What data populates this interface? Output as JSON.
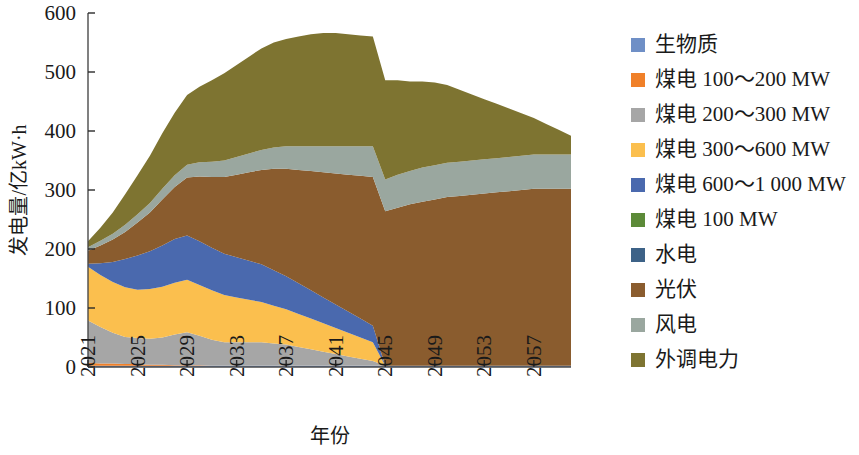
{
  "chart_data": {
    "type": "area",
    "stacked": true,
    "title": "",
    "xlabel": "年份",
    "ylabel": "发电量/亿kW·h",
    "ylim": [
      0,
      600
    ],
    "yticks": [
      0,
      100,
      200,
      300,
      400,
      500,
      600
    ],
    "xlim": [
      2021,
      2060
    ],
    "xticks": [
      2021,
      2025,
      2029,
      2033,
      2037,
      2041,
      2045,
      2049,
      2053,
      2057
    ],
    "xtick_labels": [
      "2021",
      "2025",
      "2029",
      "2033",
      "2037",
      "2041",
      "2045",
      "2049",
      "2053",
      "2057"
    ],
    "grid": false,
    "legend_position": "right",
    "x": [
      2021,
      2022,
      2023,
      2024,
      2025,
      2026,
      2027,
      2028,
      2029,
      2030,
      2031,
      2032,
      2033,
      2034,
      2035,
      2036,
      2037,
      2038,
      2039,
      2040,
      2041,
      2042,
      2043,
      2044,
      2045,
      2046,
      2047,
      2048,
      2049,
      2050,
      2051,
      2052,
      2053,
      2054,
      2055,
      2056,
      2057,
      2058,
      2059,
      2060
    ],
    "series": [
      {
        "name": "生物质",
        "color": "#6F8FC6",
        "values": [
          2,
          2,
          2,
          2,
          2,
          2,
          2,
          2,
          2,
          2,
          2,
          2,
          2,
          2,
          2,
          2,
          2,
          2,
          2,
          2,
          2,
          2,
          2,
          2,
          2,
          2,
          2,
          2,
          2,
          2,
          2,
          2,
          2,
          2,
          2,
          2,
          2,
          2,
          2,
          2
        ]
      },
      {
        "name": "煤电 100～200 MW",
        "color": "#F08029",
        "values": [
          5,
          4,
          4,
          3,
          3,
          2,
          2,
          1,
          1,
          1,
          0,
          0,
          0,
          0,
          0,
          0,
          0,
          0,
          0,
          0,
          0,
          0,
          0,
          0,
          0,
          0,
          0,
          0,
          0,
          0,
          0,
          0,
          0,
          0,
          0,
          0,
          0,
          0,
          0,
          0
        ]
      },
      {
        "name": "煤电 200～300 MW",
        "color": "#A6A6A6",
        "values": [
          72,
          62,
          52,
          46,
          44,
          44,
          46,
          52,
          56,
          50,
          44,
          40,
          40,
          40,
          40,
          38,
          36,
          32,
          28,
          24,
          20,
          16,
          12,
          8,
          0,
          0,
          0,
          0,
          0,
          0,
          0,
          0,
          0,
          0,
          0,
          0,
          0,
          0,
          0,
          0
        ]
      },
      {
        "name": "煤电 300～600 MW",
        "color": "#FBBF4E",
        "values": [
          91,
          88,
          86,
          84,
          82,
          84,
          86,
          88,
          89,
          86,
          84,
          80,
          76,
          72,
          68,
          64,
          60,
          56,
          52,
          48,
          44,
          40,
          36,
          32,
          0,
          0,
          0,
          0,
          0,
          0,
          0,
          0,
          0,
          0,
          0,
          0,
          0,
          0,
          0,
          0
        ]
      },
      {
        "name": "煤电 600～1 000 MW",
        "color": "#4A69AE",
        "values": [
          5,
          20,
          34,
          48,
          58,
          64,
          70,
          74,
          75,
          74,
          72,
          70,
          68,
          66,
          64,
          60,
          56,
          52,
          48,
          44,
          40,
          36,
          32,
          28,
          0,
          0,
          0,
          0,
          0,
          0,
          0,
          0,
          0,
          0,
          0,
          0,
          0,
          0,
          0,
          0
        ]
      },
      {
        "name": "煤电 100 MW",
        "color": "#5C8A38",
        "values": [
          0,
          0,
          0,
          0,
          0,
          0,
          0,
          0,
          0,
          0,
          0,
          0,
          0,
          0,
          0,
          0,
          0,
          0,
          0,
          0,
          0,
          0,
          0,
          0,
          0,
          0,
          0,
          0,
          0,
          0,
          0,
          0,
          0,
          0,
          0,
          0,
          0,
          0,
          0,
          0
        ]
      },
      {
        "name": "水电",
        "color": "#3D6287",
        "values": [
          0,
          0,
          0,
          0,
          0,
          0,
          0,
          0,
          0,
          0,
          0,
          0,
          0,
          0,
          0,
          0,
          0,
          0,
          0,
          0,
          0,
          0,
          0,
          0,
          0,
          0,
          0,
          0,
          0,
          0,
          0,
          0,
          0,
          0,
          0,
          0,
          0,
          0,
          0,
          0
        ]
      },
      {
        "name": "光伏",
        "color": "#8A5C2E",
        "values": [
          22,
          30,
          38,
          46,
          56,
          66,
          78,
          88,
          98,
          110,
          120,
          130,
          140,
          150,
          160,
          172,
          182,
          192,
          202,
          212,
          222,
          232,
          242,
          252,
          262,
          268,
          274,
          278,
          282,
          286,
          288,
          290,
          292,
          294,
          296,
          298,
          300,
          300,
          300,
          300
        ]
      },
      {
        "name": "风电",
        "color": "#9AA79F",
        "values": [
          6,
          8,
          10,
          12,
          14,
          16,
          18,
          20,
          22,
          24,
          26,
          28,
          30,
          32,
          34,
          36,
          38,
          40,
          42,
          44,
          46,
          48,
          50,
          52,
          54,
          56,
          56,
          58,
          58,
          58,
          58,
          58,
          58,
          58,
          58,
          58,
          58,
          58,
          58,
          58
        ]
      },
      {
        "name": "外调电力",
        "color": "#7E7431",
        "values": [
          10,
          22,
          36,
          52,
          66,
          80,
          94,
          106,
          118,
          128,
          138,
          148,
          156,
          164,
          172,
          178,
          182,
          186,
          190,
          192,
          192,
          190,
          188,
          186,
          168,
          160,
          152,
          146,
          140,
          132,
          122,
          112,
          102,
          92,
          82,
          72,
          62,
          52,
          42,
          32
        ]
      }
    ]
  },
  "legend": {
    "items": [
      {
        "label": "生物质",
        "color": "#6F8FC6"
      },
      {
        "label": "煤电 100～200 MW",
        "color": "#F08029"
      },
      {
        "label": "煤电 200～300 MW",
        "color": "#A6A6A6"
      },
      {
        "label": "煤电 300～600 MW",
        "color": "#FBBF4E"
      },
      {
        "label": "煤电 600～1 000 MW",
        "color": "#4A69AE"
      },
      {
        "label": "煤电 100 MW",
        "color": "#5C8A38"
      },
      {
        "label": "水电",
        "color": "#3D6287"
      },
      {
        "label": "光伏",
        "color": "#8A5C2E"
      },
      {
        "label": "风电",
        "color": "#9AA79F"
      },
      {
        "label": "外调电力",
        "color": "#7E7431"
      }
    ]
  }
}
